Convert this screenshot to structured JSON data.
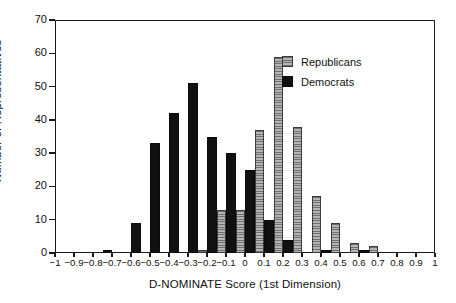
{
  "chart_data": {
    "type": "bar",
    "title": "",
    "subtitle": "",
    "xlabel": "D-NOMINATE Score (1st Dimension)",
    "ylabel": "Number of Representatives",
    "xlim": [
      -1,
      1
    ],
    "ylim": [
      0,
      70
    ],
    "bin_width": 0.05,
    "grid": false,
    "legend_position": "upper-right-inside",
    "x_ticks": [
      -1,
      -0.9,
      -0.8,
      -0.7,
      -0.6,
      -0.5,
      -0.4,
      -0.3,
      -0.2,
      -0.1,
      0,
      0.1,
      0.2,
      0.3,
      0.4,
      0.5,
      0.6,
      0.7,
      0.8,
      0.9,
      1
    ],
    "x_tick_labels": [
      "−1",
      "−0.9",
      "−0.8",
      "−0.7",
      "−0.6",
      "−0.5",
      "−0.4",
      "−0.3",
      "−0.2",
      "−0.1",
      "0",
      "0.1",
      "0.2",
      "0.3",
      "0.4",
      "0.5",
      "0.6",
      "0.7",
      "0.8",
      "0.9",
      "1"
    ],
    "y_ticks": [
      0,
      10,
      20,
      30,
      40,
      50,
      60,
      70
    ],
    "y_tick_labels": [
      "0",
      "10",
      "20",
      "30",
      "40",
      "50",
      "60",
      "70"
    ],
    "series": [
      {
        "name": "Democrats",
        "color": "#111111",
        "fill": "solid-black",
        "bins": [
          {
            "x": -0.725,
            "value": 1
          },
          {
            "x": -0.575,
            "value": 9
          },
          {
            "x": -0.475,
            "value": 33
          },
          {
            "x": -0.375,
            "value": 42
          },
          {
            "x": -0.275,
            "value": 51
          },
          {
            "x": -0.175,
            "value": 35
          },
          {
            "x": -0.075,
            "value": 30
          },
          {
            "x": 0.025,
            "value": 25
          },
          {
            "x": 0.125,
            "value": 10
          },
          {
            "x": 0.225,
            "value": 4
          },
          {
            "x": 0.425,
            "value": 1
          },
          {
            "x": 0.625,
            "value": 1
          }
        ]
      },
      {
        "name": "Republicans",
        "color": "#9a9a9a",
        "fill": "horizontal-hatch",
        "bins": [
          {
            "x": -0.225,
            "value": 1
          },
          {
            "x": -0.125,
            "value": 13
          },
          {
            "x": -0.025,
            "value": 13
          },
          {
            "x": 0.075,
            "value": 37
          },
          {
            "x": 0.175,
            "value": 59
          },
          {
            "x": 0.275,
            "value": 38
          },
          {
            "x": 0.375,
            "value": 17
          },
          {
            "x": 0.475,
            "value": 9
          },
          {
            "x": 0.575,
            "value": 3
          },
          {
            "x": 0.675,
            "value": 2
          }
        ]
      }
    ]
  },
  "legend": {
    "entries": [
      {
        "label": "Republicans",
        "kind": "rep"
      },
      {
        "label": "Democrats",
        "kind": "dem"
      }
    ]
  }
}
